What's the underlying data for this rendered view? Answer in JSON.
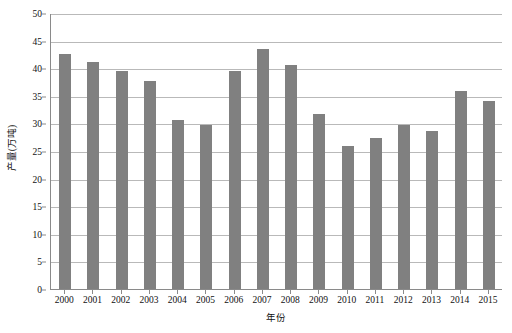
{
  "chart_data": {
    "type": "bar",
    "title": "",
    "xlabel": "年份",
    "ylabel": "产量(万吨)",
    "categories": [
      "2000",
      "2001",
      "2002",
      "2003",
      "2004",
      "2005",
      "2006",
      "2007",
      "2008",
      "2009",
      "2010",
      "2011",
      "2012",
      "2013",
      "2014",
      "2015"
    ],
    "values": [
      42.6,
      41.2,
      39.5,
      37.6,
      30.6,
      29.7,
      39.5,
      43.5,
      40.6,
      31.7,
      25.9,
      27.3,
      29.7,
      28.6,
      35.9,
      34.1
    ],
    "ylim": [
      0,
      50
    ],
    "ytick_values": [
      0,
      5,
      10,
      15,
      20,
      25,
      30,
      35,
      40,
      45,
      50
    ],
    "ytick_labels": [
      "0",
      "5",
      "10",
      "15",
      "20",
      "25",
      "30",
      "35",
      "40",
      "45",
      "50"
    ],
    "grid": true,
    "legend": null,
    "bar_color": "#808080",
    "gridline_color": "#b9b9b9",
    "axis_color": "#8a8a8a",
    "background": "#ffffff"
  }
}
